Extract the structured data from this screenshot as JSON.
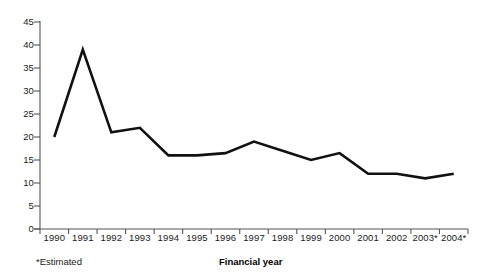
{
  "chart_data": {
    "type": "line",
    "title": "",
    "subtitle": "",
    "xlabel": "Financial year",
    "ylabel": "",
    "categories": [
      "1990",
      "1991",
      "1992",
      "1993",
      "1994",
      "1995",
      "1996",
      "1997",
      "1998",
      "1999",
      "2000",
      "2001",
      "2002",
      "2003*",
      "2004*"
    ],
    "values": [
      20,
      39,
      21,
      22,
      16,
      16,
      16.5,
      19,
      17,
      15,
      16.5,
      12,
      12,
      11,
      12
    ],
    "series": [
      {
        "name": "",
        "values": [
          20,
          39,
          21,
          22,
          16,
          16,
          16.5,
          19,
          17,
          15,
          16.5,
          12,
          12,
          11,
          12
        ]
      }
    ],
    "ylim": [
      0,
      45
    ],
    "ytick_values": [
      0,
      5,
      10,
      15,
      20,
      25,
      30,
      35,
      40,
      45
    ],
    "ytick_labels": [
      "0",
      "5",
      "10",
      "15",
      "20",
      "25",
      "30",
      "35",
      "40",
      "45"
    ],
    "grid": false,
    "legend": "none",
    "line_color": "#111111",
    "axis_color": "#555555",
    "annotations": [
      "*Estimated"
    ]
  },
  "footnote": {
    "text": "*Estimated"
  },
  "axis": {
    "x_title": "Financial year"
  }
}
